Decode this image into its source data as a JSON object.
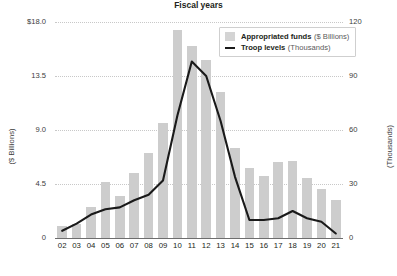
{
  "chart_data": {
    "type": "bar",
    "title": "",
    "subtitle": "",
    "xlabel": "Fiscal years",
    "categories": [
      "02",
      "03",
      "04",
      "05",
      "06",
      "07",
      "08",
      "09",
      "10",
      "11",
      "12",
      "13",
      "14",
      "15",
      "16",
      "17",
      "18",
      "19",
      "20",
      "21"
    ],
    "grid": true,
    "legend_position": "top-right",
    "axes": {
      "left": {
        "label": "($ Billions)",
        "ticks": [
          "$18.0",
          "13.5",
          "9.0",
          "4.5",
          "0"
        ],
        "tick_values": [
          18.0,
          13.5,
          9.0,
          4.5,
          0
        ],
        "min": 0,
        "max": 18.0
      },
      "right": {
        "label": "(Thousands)",
        "ticks": [
          "120",
          "90",
          "60",
          "30",
          "0"
        ],
        "tick_values": [
          120,
          90,
          60,
          30,
          0
        ],
        "min": 0,
        "max": 120
      }
    },
    "series": [
      {
        "name": "Appropriated funds",
        "unit": "($ Billions)",
        "type": "bar",
        "axis": "left",
        "color": "#cdcdcd",
        "values": [
          1.0,
          1.2,
          2.6,
          4.7,
          3.5,
          5.4,
          7.1,
          9.6,
          17.3,
          16.0,
          14.8,
          12.2,
          7.5,
          5.8,
          5.2,
          6.3,
          6.4,
          5.0,
          4.1,
          3.2
        ]
      },
      {
        "name": "Troop levels",
        "unit": "(Thousands)",
        "type": "line",
        "axis": "right",
        "color": "#1a1a1a",
        "values": [
          4,
          8,
          13,
          16,
          17,
          21,
          24,
          32,
          68,
          98,
          90,
          65,
          34,
          10,
          10,
          11,
          15,
          11,
          9,
          2.5
        ]
      }
    ]
  },
  "legend": {
    "items": [
      {
        "label": "Appropriated funds",
        "unit": "($ Billions)",
        "marker": "bar-swatch"
      },
      {
        "label": "Troop levels",
        "unit": "(Thousands)",
        "marker": "line-swatch"
      }
    ]
  }
}
